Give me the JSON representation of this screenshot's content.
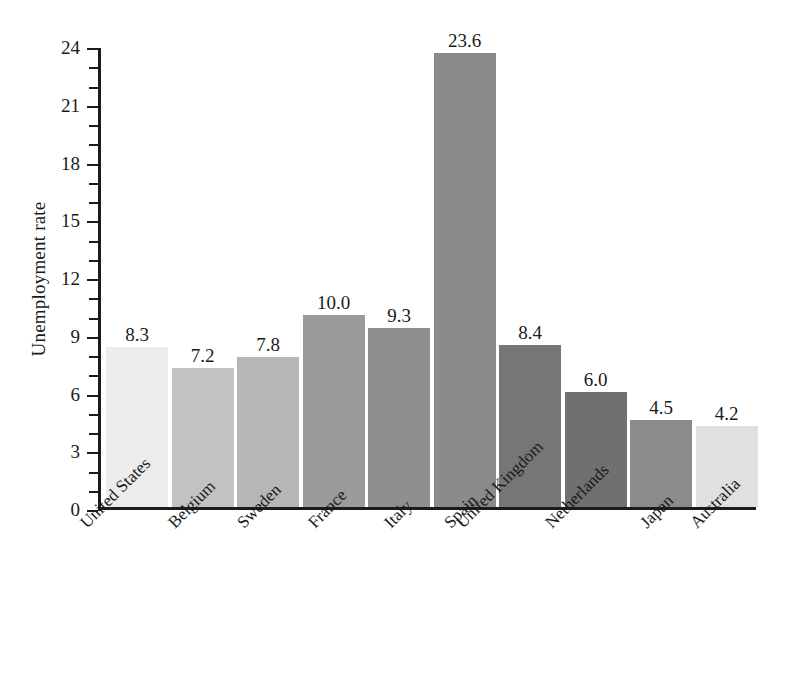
{
  "chart_data": {
    "type": "bar",
    "title": "",
    "xlabel": "",
    "ylabel": "Unemployment rate",
    "ylim": [
      0,
      24
    ],
    "ytick_step": 3,
    "yminor_step": 1,
    "grid": false,
    "legend": null,
    "categories": [
      "United States",
      "Belgium",
      "Sweden",
      "France",
      "Italy",
      "Spain",
      "United Kingdom",
      "Netherlands",
      "Japan",
      "Australia"
    ],
    "values": [
      8.3,
      7.2,
      7.8,
      10.0,
      9.3,
      23.6,
      8.4,
      6.0,
      4.5,
      4.2
    ],
    "value_labels": [
      "8.3",
      "7.2",
      "7.8",
      "10.0",
      "9.3",
      "23.6",
      "8.4",
      "6.0",
      "4.5",
      "4.2"
    ],
    "bar_colors": [
      "#ececec",
      "#c2c2c2",
      "#b6b6b6",
      "#9b9b9b",
      "#8f8f8f",
      "#8a8a8a",
      "#767676",
      "#707070",
      "#8b8b8b",
      "#e0e0e0"
    ],
    "ytick_labels": [
      "0",
      "3",
      "6",
      "9",
      "12",
      "15",
      "18",
      "21",
      "24"
    ],
    "ytick_values": [
      0,
      3,
      6,
      9,
      12,
      15,
      18,
      21,
      24
    ]
  },
  "axis": {
    "y_title": "Unemployment rate",
    "axis_color": "#1b1b1b"
  }
}
